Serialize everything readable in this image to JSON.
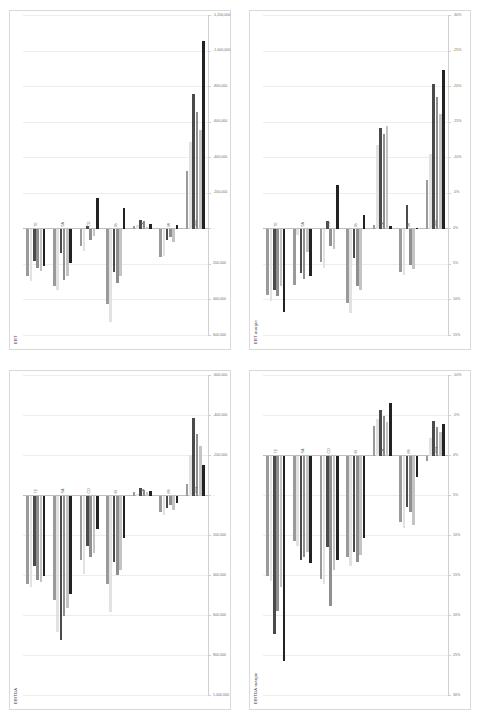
{
  "figure": {
    "layout": "2x2-grid",
    "orientation": "rotated-90",
    "background": "#ffffff",
    "series_colors": [
      "#9a9a9a",
      "#e2e2e2",
      "#4a4a4a",
      "#8f8f8f",
      "#c4c4c4",
      "#222222"
    ]
  },
  "chart_data": [
    {
      "type": "bar",
      "orientation": "horizontal",
      "title": "EBT",
      "xlabel": "",
      "ylabel": "",
      "grid": true,
      "legend": "none",
      "xlim": [
        600000,
        -1200000
      ],
      "tick_labels": [
        "600,000",
        "400,000",
        "200,000",
        "-",
        "-200,000",
        "-400,000",
        "-600,000",
        "-800,000",
        "-1,000,000",
        "-1,200,000"
      ],
      "tick_values": [
        600000,
        400000,
        200000,
        0,
        -200000,
        -400000,
        -600000,
        -800000,
        -1000000,
        -1200000
      ],
      "categories": [
        "TE",
        "SA",
        "CO",
        "IB",
        "LA",
        "MI",
        "WW"
      ],
      "series": [
        {
          "name": "S1",
          "values": [
            260000,
            320000,
            95000,
            420000,
            -18000,
            155000,
            -330000
          ]
        },
        {
          "name": "S2",
          "values": [
            290000,
            340000,
            120000,
            520000,
            -26000,
            150000,
            -490000
          ]
        },
        {
          "name": "S3",
          "values": [
            180000,
            135000,
            -20000,
            240000,
            -52000,
            60000,
            -760000
          ]
        },
        {
          "name": "S4",
          "values": [
            215000,
            285000,
            60000,
            300000,
            -46000,
            45000,
            -660000
          ]
        },
        {
          "name": "S5",
          "values": [
            235000,
            260000,
            40000,
            265000,
            -12000,
            70000,
            -560000
          ]
        },
        {
          "name": "S6",
          "values": [
            205000,
            190000,
            -175000,
            -120000,
            -30000,
            -25000,
            -1060000
          ]
        }
      ]
    },
    {
      "type": "bar",
      "orientation": "horizontal",
      "title": "EBT margin",
      "xlabel": "",
      "ylabel": "",
      "grid": true,
      "legend": "none",
      "xlim": [
        15,
        -30
      ],
      "tick_labels": [
        "15%",
        "10%",
        "5%",
        "0%",
        "-5%",
        "-10%",
        "-15%",
        "-20%",
        "-25%",
        "-30%"
      ],
      "tick_values": [
        15,
        10,
        5,
        0,
        -5,
        -10,
        -15,
        -20,
        -25,
        -30
      ],
      "categories": [
        "TE",
        "SA",
        "CO",
        "IB",
        "LA",
        "MI",
        "WW"
      ],
      "series": [
        {
          "name": "S1",
          "values": [
            9.2,
            7.8,
            4.6,
            10.4,
            -0.6,
            6.0,
            -7.0
          ]
        },
        {
          "name": "S2",
          "values": [
            10.1,
            0.8,
            5.4,
            11.8,
            -11.8,
            6.4,
            -10.6
          ]
        },
        {
          "name": "S3",
          "values": [
            8.6,
            6.2,
            -1.2,
            4.0,
            -14.2,
            -3.4,
            -20.4
          ]
        },
        {
          "name": "S4",
          "values": [
            9.4,
            7.0,
            2.4,
            8.0,
            -13.4,
            5.0,
            -18.6
          ]
        },
        {
          "name": "S5",
          "values": [
            8.0,
            3.2,
            2.8,
            8.6,
            -14.6,
            5.6,
            -16.2
          ]
        },
        {
          "name": "S6",
          "values": [
            11.6,
            6.6,
            -6.2,
            -2.0,
            -0.4,
            -0.2,
            -22.4
          ]
        }
      ]
    },
    {
      "type": "bar",
      "orientation": "horizontal",
      "title": "EBITDA",
      "xlabel": "",
      "ylabel": "",
      "grid": true,
      "legend": "none",
      "xlim": [
        1000000,
        -600000
      ],
      "tick_labels": [
        "1,000,000",
        "800,000",
        "600,000",
        "400,000",
        "200,000",
        "-",
        "-200,000",
        "-400,000",
        "-600,000"
      ],
      "tick_values": [
        1000000,
        800000,
        600000,
        400000,
        200000,
        0,
        -200000,
        -400000,
        -600000
      ],
      "categories": [
        "TE",
        "SA",
        "CO",
        "IB",
        "LA",
        "MI",
        "WW"
      ],
      "series": [
        {
          "name": "S1",
          "values": [
            440000,
            520000,
            320000,
            440000,
            -20000,
            80000,
            -60000
          ]
        },
        {
          "name": "S2",
          "values": [
            455000,
            680000,
            390000,
            580000,
            -12000,
            95000,
            -205000
          ]
        },
        {
          "name": "S3",
          "values": [
            350000,
            720000,
            250000,
            330000,
            -38000,
            60000,
            -390000
          ]
        },
        {
          "name": "S4",
          "values": [
            420000,
            600000,
            305000,
            395000,
            -30000,
            45000,
            -310000
          ]
        },
        {
          "name": "S5",
          "values": [
            430000,
            560000,
            285000,
            370000,
            -18000,
            70000,
            -250000
          ]
        },
        {
          "name": "S6",
          "values": [
            400000,
            490000,
            165000,
            210000,
            -24000,
            35000,
            -155000
          ]
        }
      ]
    },
    {
      "type": "bar",
      "orientation": "horizontal",
      "title": "EBITDA margin",
      "xlabel": "",
      "ylabel": "",
      "grid": true,
      "legend": "none",
      "xlim": [
        30,
        -10
      ],
      "tick_labels": [
        "30%",
        "25%",
        "20%",
        "15%",
        "10%",
        "5%",
        "0%",
        "-5%",
        "-10%"
      ],
      "tick_values": [
        30,
        25,
        20,
        15,
        10,
        5,
        0,
        -5,
        -10
      ],
      "categories": [
        "TE",
        "SA",
        "CO",
        "IB",
        "LA",
        "MI",
        "WW"
      ],
      "series": [
        {
          "name": "S1",
          "values": [
            15.0,
            10.6,
            15.4,
            12.6,
            -3.8,
            8.2,
            0.6
          ]
        },
        {
          "name": "S2",
          "values": [
            15.6,
            11.2,
            16.0,
            13.8,
            -4.6,
            9.0,
            -2.2
          ]
        },
        {
          "name": "S3",
          "values": [
            22.2,
            13.0,
            11.4,
            12.0,
            -5.8,
            6.4,
            -4.4
          ]
        },
        {
          "name": "S4",
          "values": [
            19.4,
            12.6,
            18.8,
            13.2,
            -5.0,
            7.0,
            -3.6
          ]
        },
        {
          "name": "S5",
          "values": [
            16.4,
            12.0,
            14.2,
            12.4,
            -4.2,
            8.6,
            -3.0
          ]
        },
        {
          "name": "S6",
          "values": [
            25.6,
            13.4,
            13.0,
            10.2,
            -6.6,
            2.6,
            -4.0
          ]
        }
      ]
    }
  ]
}
